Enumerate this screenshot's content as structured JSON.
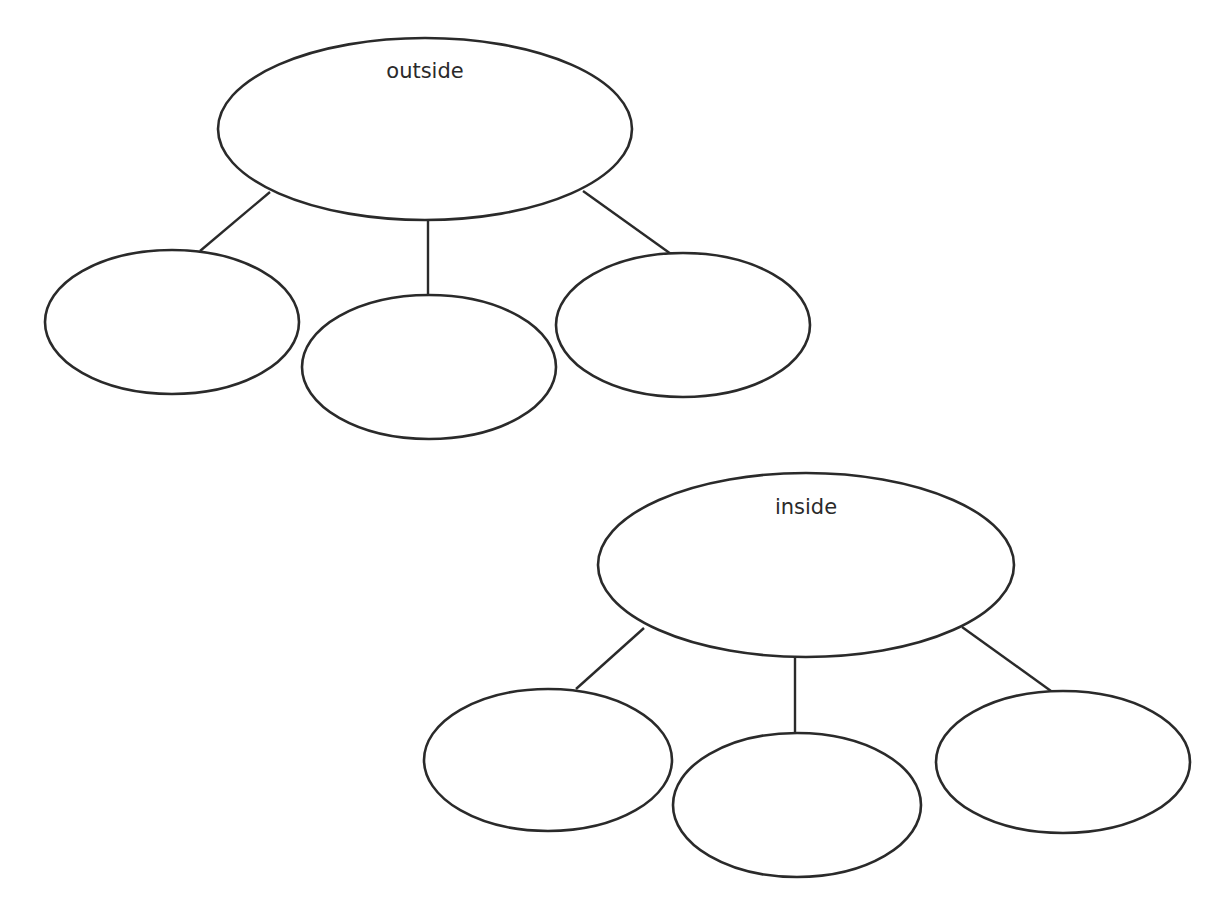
{
  "diagram": {
    "type": "tree",
    "trees": [
      {
        "root": {
          "label": "outside",
          "cx": 425,
          "cy": 129,
          "rx": 207,
          "ry": 91
        },
        "children": [
          {
            "label": "",
            "cx": 172,
            "cy": 322,
            "rx": 127,
            "ry": 72
          },
          {
            "label": "",
            "cx": 429,
            "cy": 367,
            "rx": 127,
            "ry": 72
          },
          {
            "label": "",
            "cx": 683,
            "cy": 325,
            "rx": 127,
            "ry": 72
          }
        ],
        "edges": [
          {
            "x1": 270,
            "y1": 192,
            "x2": 200,
            "y2": 251
          },
          {
            "x1": 428,
            "y1": 220,
            "x2": 428,
            "y2": 296
          },
          {
            "x1": 583,
            "y1": 191,
            "x2": 671,
            "y2": 254
          }
        ]
      },
      {
        "root": {
          "label": "inside",
          "cx": 806,
          "cy": 565,
          "rx": 208,
          "ry": 92
        },
        "children": [
          {
            "label": "",
            "cx": 548,
            "cy": 760,
            "rx": 124,
            "ry": 71
          },
          {
            "label": "",
            "cx": 797,
            "cy": 805,
            "rx": 124,
            "ry": 72
          },
          {
            "label": "",
            "cx": 1063,
            "cy": 762,
            "rx": 127,
            "ry": 71
          }
        ],
        "edges": [
          {
            "x1": 644,
            "y1": 628,
            "x2": 576,
            "y2": 689
          },
          {
            "x1": 795,
            "y1": 657,
            "x2": 795,
            "y2": 733
          },
          {
            "x1": 962,
            "y1": 627,
            "x2": 1051,
            "y2": 691
          }
        ]
      }
    ]
  },
  "labels": {
    "outside": "outside",
    "inside": "inside"
  }
}
